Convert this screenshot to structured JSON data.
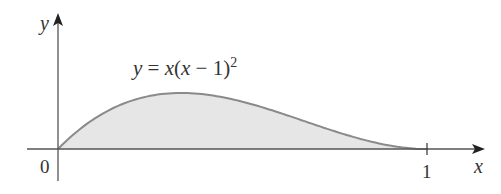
{
  "figure": {
    "equation": {
      "y": "y",
      "eq": " = ",
      "x1": "x",
      "open": "(",
      "x2": "x",
      "minus": " − 1)",
      "exp": "2"
    },
    "axis_labels": {
      "x": "x",
      "y": "y"
    },
    "tick_labels": {
      "origin": "0",
      "one": "1"
    },
    "colors": {
      "curve": "#8a8a8a",
      "fill": "#e6e6e6",
      "axis": "#555555",
      "text": "#333333"
    }
  },
  "chart_data": {
    "type": "area",
    "function": "x*(x-1)^2",
    "xlabel": "x",
    "ylabel": "y",
    "x_ticks": [
      0,
      1
    ],
    "domain": [
      0,
      1
    ],
    "x": [
      0,
      0.1,
      0.2,
      0.3333,
      0.4,
      0.5,
      0.6,
      0.7,
      0.8,
      0.9,
      1.0
    ],
    "y": [
      0,
      0.081,
      0.128,
      0.148,
      0.144,
      0.125,
      0.096,
      0.063,
      0.032,
      0.009,
      0
    ],
    "shaded_region": "area under curve between x=0 and x=1",
    "grid": false
  }
}
